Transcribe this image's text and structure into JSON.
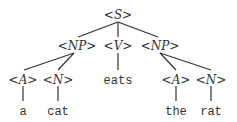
{
  "tree": {
    "root": "<S>",
    "level1": [
      "<NP>",
      "<V>",
      "<NP>"
    ],
    "level2": [
      "<A>",
      "<N>",
      "eats",
      "<A>",
      "<N>"
    ],
    "leaves": [
      "a",
      "cat",
      "the",
      "rat"
    ]
  }
}
